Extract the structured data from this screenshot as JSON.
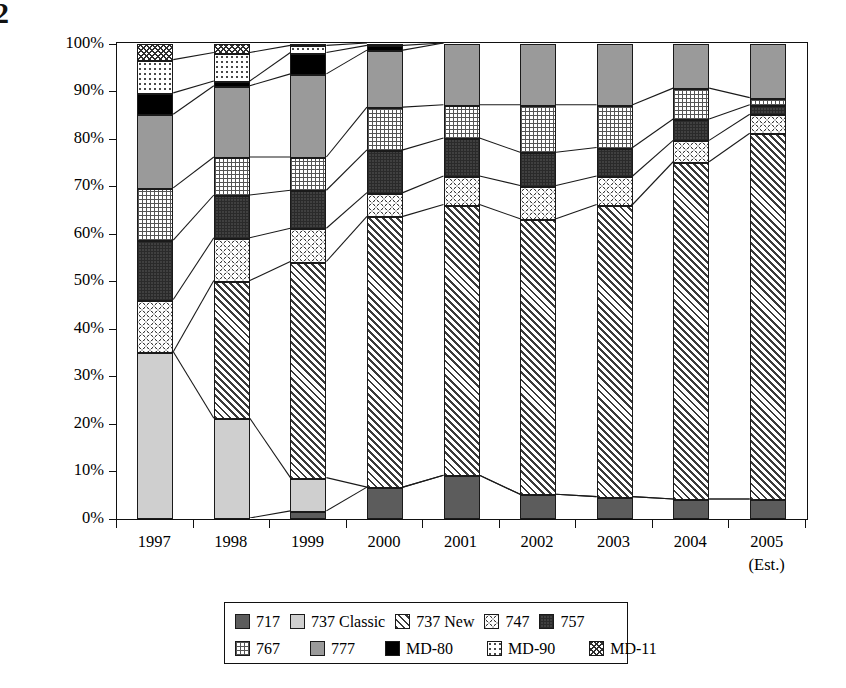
{
  "page_artifact": "2",
  "chart_data": {
    "type": "bar",
    "subtype": "stacked-100-percent",
    "title": "",
    "xlabel": "",
    "ylabel": "Percent of Total Deliveries",
    "ylim": [
      0,
      100
    ],
    "ytick_labels": [
      "0%",
      "10%",
      "20%",
      "30%",
      "40%",
      "50%",
      "60%",
      "70%",
      "80%",
      "90%",
      "100%"
    ],
    "ytick_values": [
      0,
      10,
      20,
      30,
      40,
      50,
      60,
      70,
      80,
      90,
      100
    ],
    "grid": false,
    "legend_position": "bottom",
    "categories": [
      "1997",
      "1998",
      "1999",
      "2000",
      "2001",
      "2002",
      "2003",
      "2004",
      "2005"
    ],
    "category_sublabels": [
      "",
      "",
      "",
      "",
      "",
      "",
      "",
      "",
      "(Est.)"
    ],
    "series": [
      {
        "name": "717",
        "pattern": "dark-grey-solid",
        "values": [
          0,
          0,
          1.5,
          6.5,
          9,
          5,
          4.5,
          4,
          4
        ]
      },
      {
        "name": "737 Classic",
        "pattern": "light-grey-solid",
        "values": [
          35,
          21,
          7,
          0,
          0,
          0,
          0,
          0,
          0
        ]
      },
      {
        "name": "737 New",
        "pattern": "diagonal-hatch",
        "values": [
          0,
          29,
          45.5,
          57,
          57,
          58,
          61.5,
          71,
          77
        ]
      },
      {
        "name": "747",
        "pattern": "circles",
        "values": [
          11,
          9,
          7,
          5,
          6,
          7,
          6,
          4.5,
          4
        ]
      },
      {
        "name": "757",
        "pattern": "dark-grid",
        "values": [
          12.5,
          9,
          8,
          9,
          8,
          7,
          6,
          4.5,
          2
        ]
      },
      {
        "name": "767",
        "pattern": "light-grid",
        "values": [
          11,
          8,
          7,
          9,
          7,
          10,
          9,
          6.5,
          1.5
        ]
      },
      {
        "name": "777",
        "pattern": "medium-grey-solid",
        "values": [
          15.5,
          15,
          17.5,
          12,
          13,
          13,
          13,
          9.5,
          11.5
        ]
      },
      {
        "name": "MD-80",
        "pattern": "solid-black",
        "values": [
          4.5,
          1,
          4.5,
          1,
          0,
          0,
          0,
          0,
          0
        ]
      },
      {
        "name": "MD-90",
        "pattern": "sparse-dots",
        "values": [
          7,
          6,
          1.5,
          0.5,
          0,
          0,
          0,
          0,
          0
        ]
      },
      {
        "name": "MD-11",
        "pattern": "zigzag",
        "values": [
          3.5,
          2,
          0.5,
          0,
          0,
          0,
          0,
          0,
          0
        ]
      }
    ]
  },
  "legend": {
    "rows": [
      [
        {
          "label": "717",
          "swatch": "p-717"
        },
        {
          "label": "737 Classic",
          "swatch": "p-737c"
        },
        {
          "label": "737 New",
          "swatch": "p-737n"
        },
        {
          "label": "747",
          "swatch": "p-747"
        },
        {
          "label": "757",
          "swatch": "p-757"
        }
      ],
      [
        {
          "label": "767",
          "swatch": "p-767"
        },
        {
          "label": "777",
          "swatch": "p-777"
        },
        {
          "label": "MD-80",
          "swatch": "p-md80"
        },
        {
          "label": "MD-90",
          "swatch": "p-md90"
        },
        {
          "label": "MD-11",
          "swatch": "p-md11"
        }
      ]
    ]
  },
  "colors": {
    "axis": "#111111",
    "717": "#5c5c5c",
    "737_classic": "#cfcfcf",
    "757": "#404040",
    "777": "#9a9a9a",
    "md80": "#000000"
  }
}
